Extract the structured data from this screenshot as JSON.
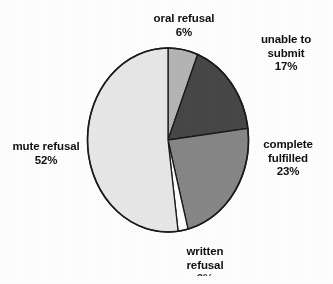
{
  "chart_data": {
    "type": "pie",
    "title": "",
    "subtitle": "",
    "xlabel": "",
    "ylabel": "",
    "legend": "none",
    "grid": false,
    "labels_position": "outside",
    "start_angle_deg": 0,
    "direction": "clockwise",
    "categories": [
      "oral refusal",
      "unable to submit",
      "complete fulfilled",
      "written refusal",
      "mute refusal"
    ],
    "values": [
      6,
      17,
      23,
      2,
      52
    ],
    "value_suffix": "%",
    "slices": [
      {
        "label": "oral refusal",
        "value": 6,
        "value_text": "6%",
        "color": "#b5b5b5",
        "start_angle_deg": 0,
        "end_angle_deg": 21.6
      },
      {
        "label": "unable to submit",
        "value": 17,
        "value_text": "17%",
        "color": "#474747",
        "start_angle_deg": 21.6,
        "end_angle_deg": 82.8
      },
      {
        "label": "complete fulfilled",
        "value": 23,
        "value_text": "23%",
        "color": "#878787",
        "start_angle_deg": 82.8,
        "end_angle_deg": 165.6
      },
      {
        "label": "written refusal",
        "value": 2,
        "value_text": "2%",
        "value_clipped": true,
        "color": "#ffffff",
        "start_angle_deg": 165.6,
        "end_angle_deg": 172.8
      },
      {
        "label": "mute refusal",
        "value": 52,
        "value_text": "52%",
        "color": "#e8e8e8",
        "start_angle_deg": 172.8,
        "end_angle_deg": 360
      }
    ],
    "outline_color": "#1a1a1a"
  },
  "labels": {
    "oral_refusal": {
      "name": "oral refusal",
      "value": "6%"
    },
    "unable_to_submit": {
      "name": "unable to",
      "name2": "submit",
      "value": "17%"
    },
    "complete_fulfilled": {
      "name": "complete",
      "name2": "fulfilled",
      "value": "23%"
    },
    "written_refusal": {
      "name": "written",
      "name2": "refusal",
      "value": "2%"
    },
    "mute_refusal": {
      "name": "mute refusal",
      "value": "52%"
    }
  }
}
